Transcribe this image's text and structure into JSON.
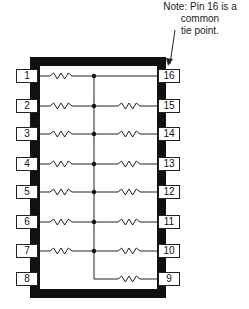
{
  "note": {
    "line1": "Note: Pin 16 is a common",
    "line2": "tie point."
  },
  "package": {
    "type": "16-pin DIP resistor network",
    "common_pin": "16"
  },
  "left_pins": [
    {
      "label": "1",
      "y": 76,
      "resistor": true
    },
    {
      "label": "2",
      "y": 106,
      "resistor": true
    },
    {
      "label": "3",
      "y": 134,
      "resistor": true
    },
    {
      "label": "4",
      "y": 164,
      "resistor": true
    },
    {
      "label": "5",
      "y": 192,
      "resistor": true
    },
    {
      "label": "6",
      "y": 222,
      "resistor": true
    },
    {
      "label": "7",
      "y": 251,
      "resistor": true
    },
    {
      "label": "8",
      "y": 279,
      "resistor": false
    }
  ],
  "right_pins": [
    {
      "label": "16",
      "y": 76,
      "resistor": false
    },
    {
      "label": "15",
      "y": 106,
      "resistor": true
    },
    {
      "label": "14",
      "y": 134,
      "resistor": true
    },
    {
      "label": "13",
      "y": 164,
      "resistor": true
    },
    {
      "label": "12",
      "y": 192,
      "resistor": true
    },
    {
      "label": "11",
      "y": 222,
      "resistor": true
    },
    {
      "label": "10",
      "y": 251,
      "resistor": true
    },
    {
      "label": "9",
      "y": 279,
      "resistor": true
    }
  ]
}
